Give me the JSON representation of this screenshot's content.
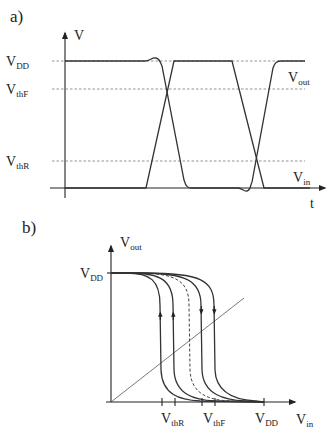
{
  "panel_a": {
    "label": "a)",
    "y_axis_label": "V",
    "x_axis_label": "t",
    "levels": [
      {
        "main": "V",
        "sub": "DD"
      },
      {
        "main": "V",
        "sub": "thF"
      },
      {
        "main": "V",
        "sub": "thR"
      }
    ],
    "signals": [
      {
        "main": "V",
        "sub": "out"
      },
      {
        "main": "V",
        "sub": "in"
      }
    ]
  },
  "panel_b": {
    "label": "b)",
    "y_axis_label": {
      "main": "V",
      "sub": "out"
    },
    "x_axis_label": {
      "main": "V",
      "sub": "in"
    },
    "y_tick": {
      "main": "V",
      "sub": "DD"
    },
    "x_ticks": [
      {
        "main": "V",
        "sub": "thR"
      },
      {
        "main": "V",
        "sub": "thF"
      },
      {
        "main": "V",
        "sub": "DD"
      }
    ]
  }
}
